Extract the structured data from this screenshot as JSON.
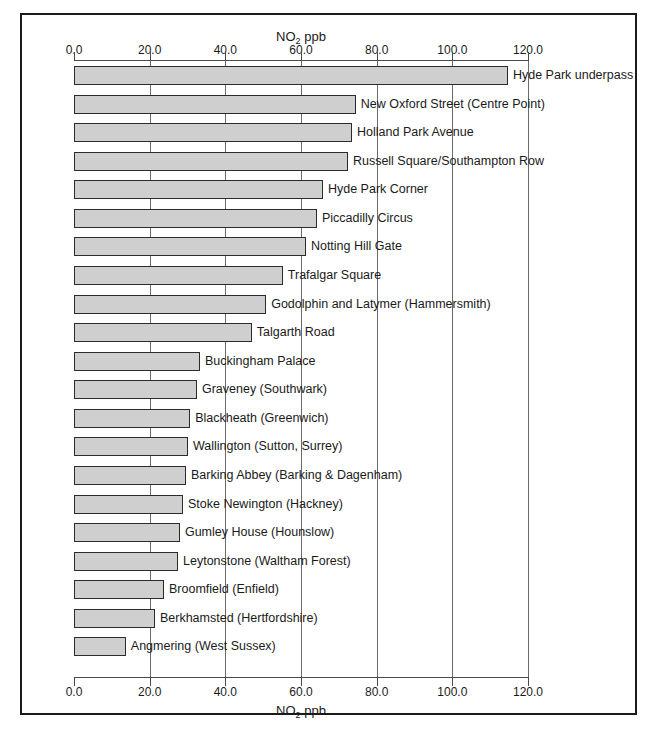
{
  "chart_data": {
    "type": "bar",
    "orientation": "horizontal",
    "title": "",
    "xlabel": "NO2 ppb",
    "xlabel_html": "NO<sub>2</sub> ppb",
    "ylabel": "",
    "xlim": [
      0.0,
      120.0
    ],
    "xticks": [
      0.0,
      20.0,
      40.0,
      60.0,
      80.0,
      100.0,
      120.0
    ],
    "xticklabels": [
      "0.0",
      "20.0",
      "40.0",
      "60.0",
      "80.0",
      "100.0",
      "120.0"
    ],
    "grid": true,
    "grid_axis": "x",
    "legend": false,
    "bar_fill": "#cfcfcf",
    "bar_edge": "#2b2b2b",
    "categories": [
      "Hyde Park underpass",
      "New Oxford Street (Centre Point)",
      "Holland Park Avenue",
      "Russell Square/Southampton Row",
      "Hyde Park Corner",
      "Piccadilly Circus",
      "Notting Hill Gate",
      "Trafalgar Square",
      "Godolphin and Latymer (Hammersmith)",
      "Talgarth Road",
      "Buckingham Palace",
      "Graveney (Southwark)",
      "Blackheath (Greenwich)",
      "Wallington (Sutton, Surrey)",
      "Barking Abbey (Barking & Dagenham)",
      "Stoke Newington (Hackney)",
      "Gumley House (Hounslow)",
      "Leytonstone (Waltham Forest)",
      "Broomfield (Enfield)",
      "Berkhamsted (Hertfordshire)",
      "Angmering (West Sussex)"
    ],
    "values": [
      114.7,
      74.5,
      73.5,
      72.4,
      65.8,
      64.2,
      61.3,
      55.2,
      50.8,
      47.0,
      33.3,
      32.5,
      30.7,
      30.1,
      29.6,
      28.8,
      28.0,
      27.5,
      23.8,
      21.4,
      13.7
    ]
  },
  "axis": {
    "top_title_html": "NO<sub>2</sub> ppb",
    "bottom_title_html": "NO<sub>2</sub> ppb"
  }
}
